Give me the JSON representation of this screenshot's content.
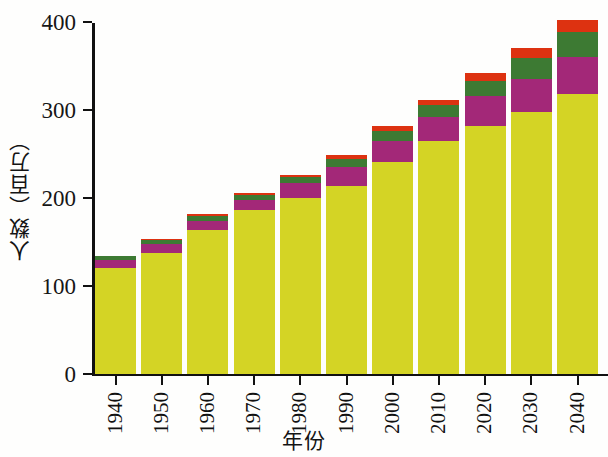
{
  "chart_data": {
    "type": "bar",
    "stacked": true,
    "title": "",
    "xlabel": "年份",
    "ylabel": "人数（百万）",
    "ylim": [
      0,
      400
    ],
    "yticks": [
      0,
      100,
      200,
      300,
      400
    ],
    "grid": false,
    "legend_position": "none",
    "categories": [
      "1940",
      "1950",
      "1960",
      "1970",
      "1980",
      "1990",
      "2000",
      "2010",
      "2020",
      "2030",
      "2040"
    ],
    "series": [
      {
        "name": "segment-1-yellow",
        "color": "#d4d425",
        "values": [
          120,
          137,
          163,
          186,
          200,
          213,
          240,
          264,
          281,
          297,
          318
        ]
      },
      {
        "name": "segment-2-magenta",
        "color": "#a32878",
        "values": [
          9,
          10,
          10,
          11,
          16,
          22,
          24,
          28,
          34,
          38,
          42
        ]
      },
      {
        "name": "segment-3-green",
        "color": "#3d7a33",
        "values": [
          4,
          5,
          6,
          6,
          7,
          9,
          12,
          13,
          18,
          24,
          28
        ]
      },
      {
        "name": "segment-4-red",
        "color": "#dd3211",
        "values": [
          0,
          1,
          2,
          2,
          3,
          4,
          5,
          6,
          8,
          11,
          14
        ]
      }
    ],
    "totals": [
      133,
      153,
      181,
      205,
      226,
      248,
      281,
      311,
      341,
      370,
      402
    ]
  },
  "axes": {
    "y_tick_labels": [
      "400",
      "300",
      "200",
      "100",
      "0"
    ],
    "y_title": "人数（百万）",
    "x_title": "年份",
    "x_tick_labels": [
      "1940",
      "1950",
      "1960",
      "1970",
      "1980",
      "1990",
      "2000",
      "2010",
      "2020",
      "2030",
      "2040"
    ]
  },
  "colors": {
    "axis": "#111111",
    "background": "#fefefd",
    "series_1": "#d4d425",
    "series_2": "#a32878",
    "series_3": "#3d7a33",
    "series_4": "#dd3211"
  }
}
